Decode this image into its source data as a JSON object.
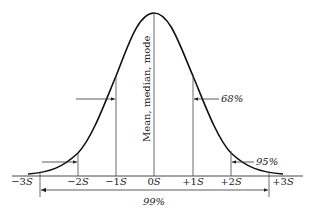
{
  "center_label": "Mean, median, mode",
  "axis_ticks": [
    {
      "sign": "−3",
      "unit": "S"
    },
    {
      "sign": "−2",
      "unit": "S"
    },
    {
      "sign": "−1",
      "unit": "S"
    },
    {
      "sign": "0",
      "unit": "S"
    },
    {
      "sign": "+1",
      "unit": "S"
    },
    {
      "sign": "+2",
      "unit": "S"
    },
    {
      "sign": "+3",
      "unit": "S"
    }
  ],
  "ranges": {
    "one_sd": "68%",
    "two_sd": "95%",
    "three_sd": "99%"
  },
  "colors": {
    "line": "#222222",
    "thin": "#444444",
    "background": "#ffffff"
  }
}
